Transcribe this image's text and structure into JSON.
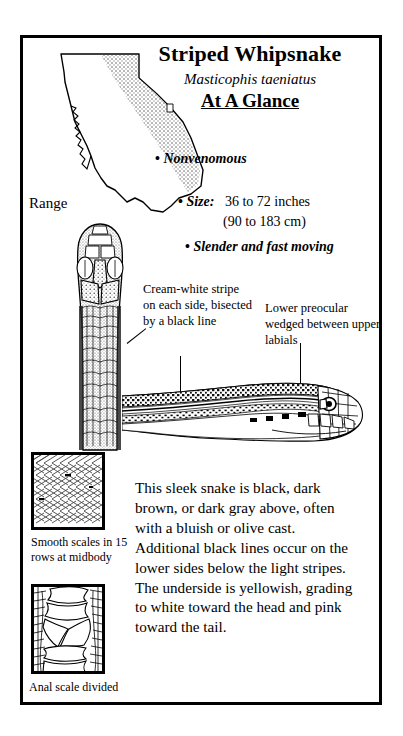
{
  "card": {
    "common_name": "Striped Whipsnake",
    "scientific_name": "Masticophis taeniatus",
    "section_heading": "At A Glance"
  },
  "map": {
    "label": "Range",
    "region_name": "California",
    "shading_description": "stippled gray range band along eastern California"
  },
  "facts": {
    "venom": "Nonvenomous",
    "size_label": "Size:",
    "size_imperial": "36 to 72 inches",
    "size_metric": "(90 to 183 cm)",
    "behavior": "Slender and fast moving",
    "bullet_glyph": "•"
  },
  "callouts": {
    "stripe": "Cream-white stripe on each side, bisected by a black line",
    "preocular": "Lower preocular wedged between upper labials"
  },
  "illustrations": {
    "dorsal_head": "dorsal-head-illustration",
    "lateral_head": "lateral-head-illustration"
  },
  "scale_details": [
    {
      "caption": "Smooth scales in 15 rows at midbody",
      "icon": "midbody-scales-illustration"
    },
    {
      "caption": "Anal scale divided",
      "icon": "anal-scale-illustration"
    }
  ],
  "colors": {
    "ink": "#000000",
    "paper": "#ffffff",
    "range_shading": "#c9c9c9"
  }
}
